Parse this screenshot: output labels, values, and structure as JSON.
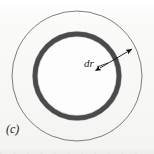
{
  "figure": {
    "panel_label": "(c)",
    "annotation_label": "dr",
    "caption_sliver": ". . .  . . . .  . .  . .",
    "background_color": "#f7f7f6",
    "outer_circle_color": "#6e6e6e",
    "ring_band_color": "#4a4a4a",
    "interior_color": "#fdfdfd",
    "arrow_color": "#111111",
    "text_color": "#1d1d1d"
  },
  "chart_data": {
    "type": "diagram",
    "title": "",
    "subtitle": "",
    "panel": "(c)",
    "shapes": [
      {
        "name": "outer-circle",
        "kind": "circle",
        "cx": 77,
        "cy": 76,
        "r": 65,
        "stroke": "#6e6e6e",
        "stroke_width": 0.9,
        "fill": "none"
      },
      {
        "name": "ring-band",
        "kind": "annulus",
        "cx": 77,
        "cy": 76,
        "r": 42,
        "stroke": "#4a4a4a",
        "stroke_width": 5,
        "fill": "none"
      },
      {
        "name": "interior-disc",
        "kind": "circle",
        "cx": 77,
        "cy": 76,
        "r": 39,
        "fill": "#fdfdfd"
      }
    ],
    "annotations": [
      {
        "name": "dr-arrow",
        "kind": "double-headed-arrow",
        "label": "dr",
        "x1": 100,
        "y1": 68,
        "x2": 132,
        "y2": 49,
        "points_to": "ring-band"
      },
      {
        "name": "dr-leader",
        "kind": "leader-line",
        "x1": 97,
        "y1": 67,
        "x2": 108,
        "y2": 63
      }
    ],
    "axis": {
      "grid": false,
      "legend": false
    },
    "xlabel": "",
    "ylabel": ""
  }
}
